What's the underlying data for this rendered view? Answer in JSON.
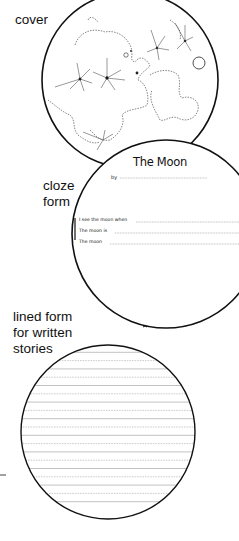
{
  "labels": {
    "cover": "cover",
    "cloze": [
      "cloze",
      "form"
    ],
    "lined": [
      "lined form",
      "for written",
      "stories"
    ]
  },
  "cloze_form": {
    "title": "The Moon",
    "by_label": "by",
    "prompts": [
      "I see the moon when",
      "The moon is",
      "The moon"
    ]
  },
  "lined_form": {
    "line_count": 20
  },
  "colors": {
    "ink": "#111111",
    "rule": "#999999",
    "background": "#ffffff"
  }
}
